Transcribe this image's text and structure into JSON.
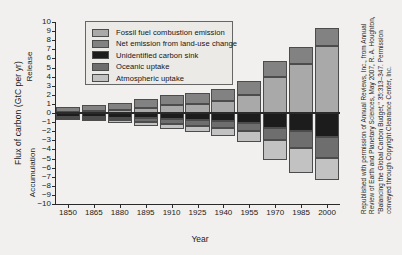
{
  "chart_data": {
    "type": "bar",
    "stacked": true,
    "title": "",
    "xlabel": "Year",
    "ylabel": "Flux of carbon (GtC per yr)",
    "ylim": [
      -10,
      10
    ],
    "xlim": [
      1850,
      2000
    ],
    "grid": false,
    "legend_position": "top-center",
    "axis_region_labels": {
      "positive": "Release",
      "negative": "Accumulation"
    },
    "ytick_labels": [
      "10",
      "9",
      "8",
      "7",
      "6",
      "5",
      "4",
      "3",
      "2",
      "1",
      "0",
      "-1",
      "-2",
      "-3",
      "-4",
      "-5",
      "-6",
      "-7",
      "-8",
      "-9",
      "-10"
    ],
    "ytick_values": [
      10,
      9,
      8,
      7,
      6,
      5,
      4,
      3,
      2,
      1,
      0,
      -1,
      -2,
      -3,
      -4,
      -5,
      -6,
      -7,
      -8,
      -9,
      -10
    ],
    "categories": [
      1850,
      1865,
      1880,
      1895,
      1910,
      1925,
      1940,
      1955,
      1970,
      1985,
      2000
    ],
    "xtick_labels": [
      "1850",
      "1865",
      "1880",
      "1895",
      "1910",
      "1925",
      "1940",
      "1955",
      "1970",
      "1985",
      "2000"
    ],
    "series": [
      {
        "name": "Fossil fuel combustion emission",
        "color": "#a9a9a9",
        "values": [
          0.1,
          0.2,
          0.3,
          0.6,
          0.9,
          1.0,
          1.3,
          2.0,
          4.0,
          5.4,
          7.4
        ]
      },
      {
        "name": "Net emission from land-use change",
        "color": "#828282",
        "values": [
          0.6,
          0.7,
          0.8,
          0.9,
          1.1,
          1.2,
          1.3,
          1.5,
          1.7,
          1.8,
          1.9
        ]
      },
      {
        "name": "Unidentified carbon sink",
        "color": "#1c1c1c",
        "values": [
          -0.4,
          -0.45,
          -0.5,
          -0.6,
          -0.7,
          -0.8,
          -0.9,
          -1.1,
          -1.6,
          -2.0,
          -2.6
        ]
      },
      {
        "name": "Oceanic uptake",
        "color": "#6e6e6e",
        "values": [
          -0.2,
          -0.25,
          -0.3,
          -0.4,
          -0.5,
          -0.6,
          -0.7,
          -0.9,
          -1.4,
          -1.8,
          -2.3
        ]
      },
      {
        "name": "Atmospheric uptake",
        "color": "#c2c2c2",
        "values": [
          -0.1,
          -0.15,
          -0.25,
          -0.4,
          -0.6,
          -0.7,
          -0.9,
          -1.2,
          -2.2,
          -2.8,
          -2.5
        ]
      }
    ]
  },
  "credit": {
    "text": "Republished with permission of Annual Reviews, Inc., from Annual Review of Earth and Planetary Sciences, May 2007, R. A. Houghton, \"Balancing the Global Carbon Budget,\" 35:313–347. Permission conveyed through Copyright Clearance Center, Inc."
  }
}
